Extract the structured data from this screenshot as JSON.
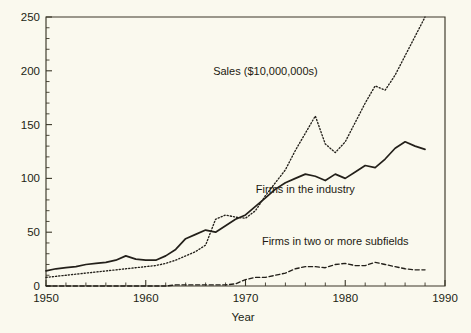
{
  "chart_data": {
    "type": "line",
    "title": "",
    "xlabel": "Year",
    "ylabel": "",
    "xlim": [
      1950,
      1990
    ],
    "ylim": [
      0,
      250
    ],
    "grid": false,
    "legend_position": "inline-annotations",
    "x_ticks_major": [
      1950,
      1960,
      1970,
      1980,
      1990
    ],
    "x_ticks_minor_step": 2,
    "y_ticks_major": [
      0,
      50,
      100,
      150,
      200,
      250
    ],
    "y_ticks_minor_step": 10,
    "x_tick_labels": [
      "1950",
      "1960",
      "1970",
      "1980",
      "1990"
    ],
    "y_tick_labels": [
      "0",
      "50",
      "100",
      "150",
      "200",
      "250"
    ],
    "x": [
      1950,
      1951,
      1952,
      1953,
      1954,
      1955,
      1956,
      1957,
      1958,
      1959,
      1960,
      1961,
      1962,
      1963,
      1964,
      1965,
      1966,
      1967,
      1968,
      1969,
      1970,
      1971,
      1972,
      1973,
      1974,
      1975,
      1976,
      1977,
      1978,
      1979,
      1980,
      1981,
      1982,
      1983,
      1984,
      1985,
      1986,
      1987,
      1988
    ],
    "series": [
      {
        "name": "Sales ($10,000,000s)",
        "style": "dotted",
        "label_x": 1972,
        "label_y": 196,
        "values": [
          8,
          9,
          10,
          11,
          12,
          13,
          14,
          15,
          16,
          17,
          18,
          19,
          21,
          24,
          28,
          32,
          38,
          62,
          66,
          64,
          63,
          70,
          84,
          96,
          108,
          126,
          142,
          158,
          132,
          124,
          134,
          152,
          170,
          186,
          182,
          196,
          214,
          232,
          250
        ]
      },
      {
        "name": "Firms in the industry",
        "style": "solid",
        "label_x": 1976,
        "label_y": 86,
        "values": [
          14,
          16,
          17,
          18,
          20,
          21,
          22,
          24,
          28,
          25,
          24,
          24,
          28,
          34,
          44,
          48,
          52,
          50,
          56,
          62,
          66,
          74,
          82,
          90,
          96,
          100,
          104,
          102,
          98,
          104,
          100,
          106,
          112,
          110,
          118,
          128,
          134,
          130,
          127
        ]
      },
      {
        "name": "Firms in two or more subfields",
        "style": "dashed",
        "label_x": 1979,
        "label_y": 38,
        "values": [
          0,
          0,
          0,
          0,
          0,
          0,
          0,
          0,
          0,
          0,
          0,
          0,
          0,
          1,
          1,
          1,
          1,
          1,
          1,
          2,
          6,
          8,
          8,
          10,
          12,
          16,
          18,
          18,
          17,
          20,
          21,
          19,
          19,
          22,
          20,
          18,
          16,
          15,
          15
        ]
      }
    ]
  },
  "colors": {
    "background": "#faf9ee",
    "ink": "#23201a",
    "axis": "#3b3728"
  }
}
